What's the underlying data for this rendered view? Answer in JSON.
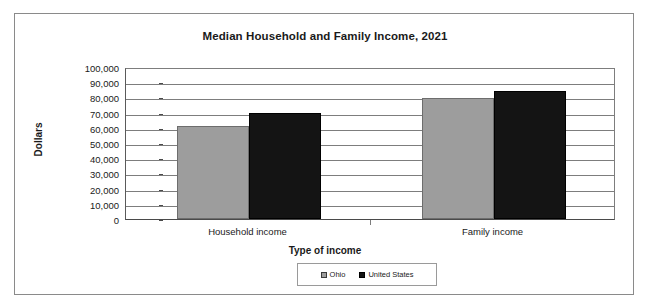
{
  "chart_data": {
    "type": "bar",
    "title": "Median Household and Family Income, 2021",
    "xlabel": "Type of income",
    "ylabel": "Dollars",
    "categories": [
      "Household income",
      "Family income"
    ],
    "series": [
      {
        "name": "Ohio",
        "values": [
          61400,
          79400
        ],
        "color": "#9d9d9d"
      },
      {
        "name": "United States",
        "values": [
          69500,
          84400
        ],
        "color": "#141414"
      }
    ],
    "ylim": [
      0,
      100000
    ],
    "ytick_values": [
      100000,
      90000,
      80000,
      70000,
      60000,
      50000,
      40000,
      30000,
      20000,
      10000,
      0
    ],
    "ytick_labels": [
      "100,000",
      "90,000",
      "80,000",
      "70,000",
      "60,000",
      "50,000",
      "40,000",
      "30,000",
      "20,000",
      "10,000",
      "0"
    ],
    "grid": true,
    "grid_axis": "y",
    "legend_position": "bottom",
    "legend_entries": [
      "Ohio",
      "United States"
    ]
  },
  "frame": {
    "border_color": "#8a8a8a",
    "background": "#ffffff"
  }
}
